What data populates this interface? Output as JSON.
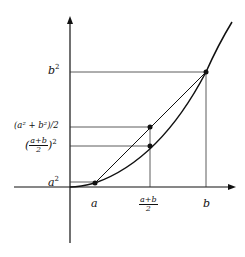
{
  "diagram": {
    "title": "",
    "curve": "y = x^2 (convex function)",
    "labels": {
      "x_a": "a",
      "x_mid_num": "a+b",
      "x_mid_den": "2",
      "x_b": "b",
      "y_a2": "a",
      "y_b2": "b",
      "y_avg_sq": "(a² + b²)/2",
      "y_sq_avg_num": "a+b",
      "y_sq_avg_den": "2",
      "sup2": "2"
    },
    "points": [
      {
        "name": "A",
        "label": "(a, a²)"
      },
      {
        "name": "B",
        "label": "(b, b²)"
      },
      {
        "name": "chord-midpoint",
        "label": "((a+b)/2, (a²+b²)/2)"
      },
      {
        "name": "curve-midpoint",
        "label": "((a+b)/2, ((a+b)/2)²)"
      }
    ]
  }
}
